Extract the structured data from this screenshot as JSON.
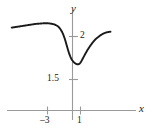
{
  "chart_data": {
    "type": "line",
    "title": "",
    "xlabel": "x",
    "ylabel": "y",
    "grid": false,
    "legend": null,
    "xlim": [
      -7.8,
      5.0
    ],
    "ylim": [
      0,
      3.05
    ],
    "x_ticks": [
      {
        "value": -3,
        "label": "–3"
      },
      {
        "value": 1,
        "label": "1"
      }
    ],
    "y_ticks": [
      {
        "value": 2.0,
        "label": "2"
      },
      {
        "value": 1.5,
        "label": "1.5"
      }
    ],
    "axis_color": "#999999",
    "curve_color": "#1a1a1a",
    "series": [
      {
        "name": "curve",
        "x": [
          -7.6,
          -7.0,
          -6.4,
          -5.8,
          -5.2,
          -4.6,
          -4.0,
          -3.4,
          -2.8,
          -2.2,
          -1.7,
          -1.3,
          -1.0,
          -0.75,
          -0.55,
          -0.35,
          -0.15,
          0.0,
          0.15,
          0.3,
          0.45,
          0.6,
          0.75,
          0.9,
          1.1,
          1.4,
          1.75,
          2.1,
          2.5,
          2.9,
          3.3,
          3.7,
          4.1,
          4.45,
          4.75
        ],
        "y": [
          2.24,
          2.26,
          2.28,
          2.3,
          2.32,
          2.34,
          2.35,
          2.36,
          2.35,
          2.32,
          2.25,
          2.12,
          1.96,
          1.78,
          1.63,
          1.5,
          1.4,
          1.35,
          1.31,
          1.28,
          1.26,
          1.25,
          1.25,
          1.27,
          1.33,
          1.45,
          1.59,
          1.71,
          1.83,
          1.93,
          2.0,
          2.06,
          2.1,
          2.12,
          2.13
        ]
      }
    ]
  },
  "labels": {
    "y_axis": "y",
    "x_axis": "x",
    "tick_2": "2",
    "tick_1_5": "1.5",
    "tick_neg3": "–3",
    "tick_1": "1"
  }
}
